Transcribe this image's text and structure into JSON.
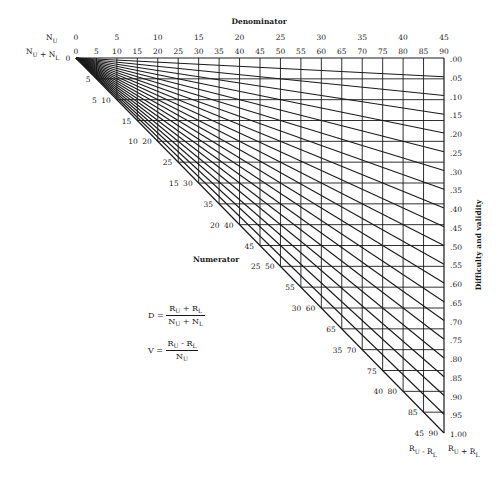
{
  "chart_data": {
    "type": "nomograph",
    "title": "Denominator",
    "top_axis": {
      "row1_label": "N_U",
      "row1_ticks": [
        "0",
        "5",
        "10",
        "15",
        "20",
        "25",
        "30",
        "35",
        "40",
        "45"
      ],
      "row2_label": "N_U + N_L",
      "row2_ticks": [
        "0",
        "5",
        "10",
        "15",
        "20",
        "25",
        "30",
        "35",
        "40",
        "45",
        "50",
        "55",
        "60",
        "65",
        "70",
        "75",
        "80",
        "85",
        "90"
      ]
    },
    "origin_label": "0",
    "diagonal_axis": {
      "label": "Numerator",
      "col1_label": "R_U - R_L",
      "col2_label": "R_U + R_L",
      "ticks": [
        {
          "outer": "",
          "inner": "5"
        },
        {
          "outer": "5",
          "inner": "10"
        },
        {
          "outer": "",
          "inner": "15"
        },
        {
          "outer": "10",
          "inner": "20"
        },
        {
          "outer": "",
          "inner": "25"
        },
        {
          "outer": "15",
          "inner": "30"
        },
        {
          "outer": "",
          "inner": "35"
        },
        {
          "outer": "20",
          "inner": "40"
        },
        {
          "outer": "",
          "inner": "45"
        },
        {
          "outer": "25",
          "inner": "50"
        },
        {
          "outer": "",
          "inner": "55"
        },
        {
          "outer": "30",
          "inner": "60"
        },
        {
          "outer": "",
          "inner": "65"
        },
        {
          "outer": "35",
          "inner": "70"
        },
        {
          "outer": "",
          "inner": "75"
        },
        {
          "outer": "40",
          "inner": "80"
        },
        {
          "outer": "",
          "inner": "85"
        },
        {
          "outer": "45",
          "inner": "90"
        }
      ]
    },
    "right_axis": {
      "label": "Difficulty and validity",
      "ticks": [
        ".00",
        ".05",
        ".10",
        ".15",
        ".20",
        ".25",
        ".30",
        ".35",
        ".40",
        ".45",
        ".50",
        ".55",
        ".60",
        ".65",
        ".70",
        ".75",
        ".80",
        ".85",
        ".90",
        ".95",
        "1.00"
      ],
      "values": [
        0,
        0.05,
        0.1,
        0.15,
        0.2,
        0.25,
        0.3,
        0.35,
        0.4,
        0.45,
        0.5,
        0.55,
        0.6,
        0.65,
        0.7,
        0.75,
        0.8,
        0.85,
        0.9,
        0.95,
        1.0
      ]
    },
    "grid": {
      "denominator_range": [
        0,
        90
      ],
      "numerator_range": [
        0,
        90
      ],
      "step": 5
    }
  },
  "formulas": {
    "d_lhs": "D =",
    "d_num_a": "R",
    "d_num_a_sub": "U",
    "d_num_op": " + ",
    "d_num_b": "R",
    "d_num_b_sub": "L",
    "d_den_a": "N",
    "d_den_a_sub": "U",
    "d_den_op": " + ",
    "d_den_b": "N",
    "d_den_b_sub": "L",
    "v_lhs": "V =",
    "v_num_a": "R",
    "v_num_a_sub": "U",
    "v_num_op": " - ",
    "v_num_b": "R",
    "v_num_b_sub": "L",
    "v_den_a": "N",
    "v_den_a_sub": "U"
  }
}
